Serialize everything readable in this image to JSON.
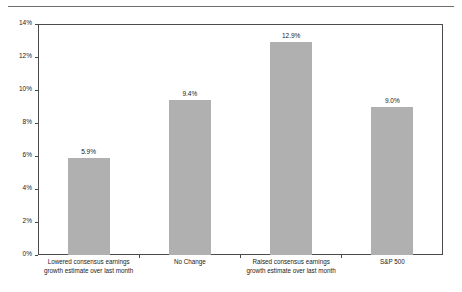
{
  "chart_data": {
    "type": "bar",
    "title": "",
    "subtitle": "",
    "xlabel": "",
    "ylabel": "",
    "ylim": [
      0,
      14
    ],
    "ytick_step": 2,
    "grid": false,
    "legend": null,
    "bar_color": "#b0b0b0",
    "axis_color": "#4a4a4a",
    "text_color": "#1a1a1a",
    "categories": [
      "Lowered consensus earnings growth estimate over last month",
      "No Change",
      "Raised consensus earnings growth estimate over last month",
      "S&P 500"
    ],
    "category_lines": [
      [
        "Lowered consensus earnings",
        "growth estimate over last month"
      ],
      [
        "No Change",
        ""
      ],
      [
        "Raised consensus earnings",
        "growth estimate over last month"
      ],
      [
        "S&P 500",
        ""
      ]
    ],
    "values": [
      5.9,
      9.4,
      12.9,
      9.0
    ],
    "value_labels": [
      "5.9%",
      "9.4%",
      "12.9%",
      "9.0%"
    ],
    "ytick_labels": [
      "0%",
      "2%",
      "4%",
      "6%",
      "8%",
      "10%",
      "12%",
      "14%"
    ],
    "ytick_values": [
      0,
      2,
      4,
      6,
      8,
      10,
      12,
      14
    ]
  }
}
